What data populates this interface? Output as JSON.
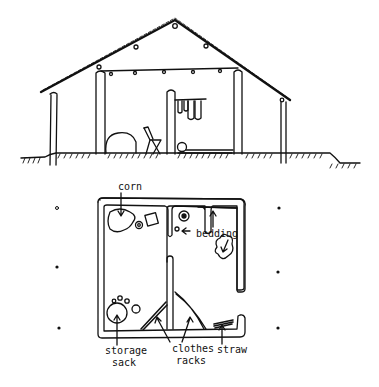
{
  "diagram": {
    "elevation": {
      "name": "house cross-section"
    },
    "plan": {
      "labels": {
        "corn": "corn",
        "bedding": "bedding",
        "storage_line1": "storage",
        "storage_line2": "sack",
        "clothes_line1": "clothes",
        "clothes_line2": "racks",
        "straw": "straw"
      }
    },
    "colors": {
      "ink": "#111111",
      "paper": "#ffffff"
    }
  }
}
